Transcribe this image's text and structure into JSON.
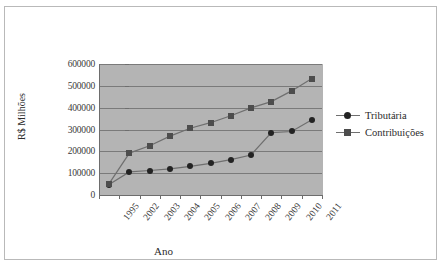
{
  "chart_data": {
    "type": "line",
    "title": "",
    "xlabel": "Ano",
    "ylabel": "R$ Milhões",
    "categories": [
      "1995",
      "2002",
      "2003",
      "2004",
      "2005",
      "2006",
      "2007",
      "2008",
      "2009",
      "2010",
      "2011"
    ],
    "ylim": [
      0,
      600000
    ],
    "ytick_labels": [
      "600000",
      "500000",
      "400000",
      "300000",
      "200000",
      "100000",
      "0"
    ],
    "ytick_values": [
      600000,
      500000,
      400000,
      300000,
      200000,
      100000,
      0
    ],
    "grid": true,
    "legend_position": "right",
    "plot_background": "#b4b4b4",
    "series": [
      {
        "name": "Tributária",
        "marker": "circle",
        "color": "#232323",
        "values": [
          48000,
          106000,
          112000,
          120000,
          131000,
          145000,
          162000,
          183000,
          286000,
          291000,
          345000
        ]
      },
      {
        "name": "Contribuições",
        "marker": "square",
        "color": "#4d4d4d",
        "values": [
          52000,
          192000,
          226000,
          270000,
          306000,
          331000,
          363000,
          399000,
          428000,
          477000,
          533000
        ]
      }
    ]
  }
}
